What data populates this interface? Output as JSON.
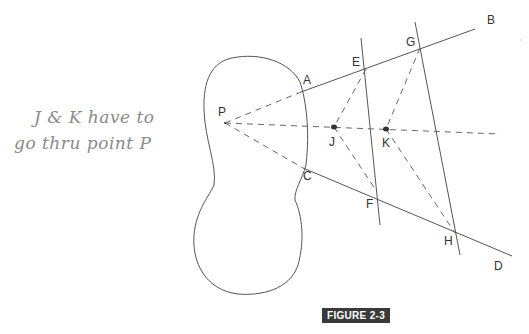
{
  "annotation": {
    "line1": "J & K have to",
    "line2": "go thru point P"
  },
  "figure": {
    "caption": "FIGURE 2-3",
    "points": {
      "P": {
        "label": "P",
        "x": 225,
        "y": 123
      },
      "A": {
        "label": "A",
        "x": 301,
        "y": 92
      },
      "B": {
        "label": "B",
        "x": 478,
        "y": 28
      },
      "C": {
        "label": "C",
        "x": 303,
        "y": 168
      },
      "D": {
        "label": "D",
        "x": 512,
        "y": 258
      },
      "E": {
        "label": "E",
        "x": 366,
        "y": 69
      },
      "F": {
        "label": "F",
        "x": 377,
        "y": 192
      },
      "G": {
        "label": "G",
        "x": 420,
        "y": 48
      },
      "H": {
        "label": "H",
        "x": 455,
        "y": 233
      },
      "J": {
        "label": "J",
        "x": 334,
        "y": 127
      },
      "K": {
        "label": "K",
        "x": 386,
        "y": 129
      }
    },
    "colors": {
      "line": "#555555",
      "caption_bg": "#3a3a3a",
      "handwriting": "#8a8a8a"
    }
  }
}
